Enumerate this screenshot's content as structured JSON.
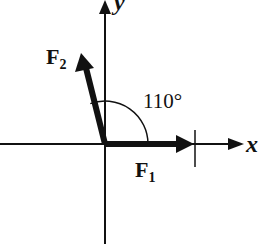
{
  "diagram": {
    "type": "vector-force-diagram",
    "axes": {
      "x_label": "x",
      "y_label": "y"
    },
    "vectors": [
      {
        "name": "F",
        "subscript": "1",
        "direction_deg": 0
      },
      {
        "name": "F",
        "subscript": "2",
        "direction_deg": 110
      }
    ],
    "angle_label": "110°",
    "colors": {
      "ink": "#111111",
      "background": "#ffffff"
    }
  }
}
